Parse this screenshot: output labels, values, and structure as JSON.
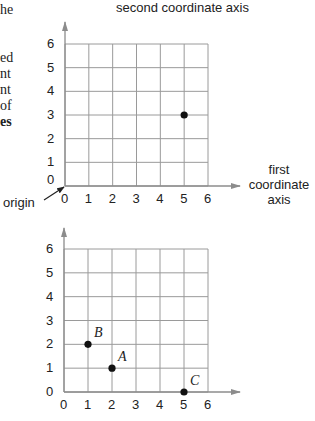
{
  "left_text_fragments": [
    {
      "text": "he",
      "bold": false
    },
    {
      "text": "ed",
      "bold": false
    },
    {
      "text": "nt",
      "bold": false
    },
    {
      "text": "nt",
      "bold": false
    },
    {
      "text": "of",
      "bold": false
    },
    {
      "text": "es",
      "bold": true
    }
  ],
  "top_diagram": {
    "y_axis_title": "second coordinate axis",
    "x_axis_title_lines": [
      "first",
      "coordinate",
      "axis"
    ],
    "origin_label": "origin",
    "origin_y_label": "0"
  },
  "bottom_diagram": {},
  "colors": {
    "grid": "#9a9a9a",
    "axis": "#8c8c8c",
    "point": "#111111"
  },
  "chart_data": [
    {
      "type": "scatter",
      "title": "",
      "xlabel": "first coordinate axis",
      "ylabel": "second coordinate axis",
      "x_ticks": [
        "0",
        "1",
        "2",
        "3",
        "4",
        "5",
        "6"
      ],
      "y_ticks": [
        "0",
        "1",
        "2",
        "3",
        "4",
        "5",
        "6"
      ],
      "xlim": [
        0,
        6
      ],
      "ylim": [
        0,
        6
      ],
      "grid": true,
      "annotations": [
        {
          "text": "origin",
          "target": [
            0,
            0
          ]
        }
      ],
      "points": [
        {
          "x": 5,
          "y": 3,
          "label": ""
        }
      ]
    },
    {
      "type": "scatter",
      "title": "",
      "xlabel": "",
      "ylabel": "",
      "x_ticks": [
        "0",
        "1",
        "2",
        "3",
        "4",
        "5",
        "6"
      ],
      "y_ticks": [
        "0",
        "1",
        "2",
        "3",
        "4",
        "5",
        "6"
      ],
      "xlim": [
        0,
        6
      ],
      "ylim": [
        0,
        6
      ],
      "grid": true,
      "points": [
        {
          "x": 1,
          "y": 2,
          "label": "B"
        },
        {
          "x": 2,
          "y": 1,
          "label": "A"
        },
        {
          "x": 5,
          "y": 0,
          "label": "C"
        }
      ]
    }
  ]
}
